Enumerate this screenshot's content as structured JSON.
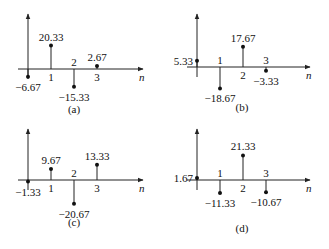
{
  "chart_data": [
    {
      "type": "stem",
      "panel": "(a)",
      "x": [
        0,
        1,
        2,
        3
      ],
      "values": [
        -6.67,
        20.33,
        -15.33,
        2.67
      ],
      "value_labels": [
        "-6.67",
        "20.33",
        "-15.33",
        "2.67"
      ],
      "xlabel": "n",
      "tick_labels": [
        "1",
        "2",
        "3"
      ],
      "caption": "(a)"
    },
    {
      "type": "stem",
      "panel": "(b)",
      "x": [
        0,
        1,
        2,
        3
      ],
      "values": [
        5.33,
        -18.67,
        17.67,
        -3.33
      ],
      "value_labels": [
        "5.33",
        "-18.67",
        "17.67",
        "-3.33"
      ],
      "xlabel": "n",
      "tick_labels": [
        "1",
        "2",
        "3"
      ],
      "caption": "(b)"
    },
    {
      "type": "stem",
      "panel": "(c)",
      "x": [
        0,
        1,
        2,
        3
      ],
      "values": [
        -1.33,
        9.67,
        -20.67,
        13.33
      ],
      "value_labels": [
        "-1.33",
        "9.67",
        "-20.67",
        "13.33"
      ],
      "xlabel": "n",
      "tick_labels": [
        "1",
        "2",
        "3"
      ],
      "caption": "(c)"
    },
    {
      "type": "stem",
      "panel": "(d)",
      "x": [
        0,
        1,
        2,
        3
      ],
      "values": [
        1.67,
        -11.33,
        21.33,
        -10.67
      ],
      "value_labels": [
        "1.67",
        "-11.33",
        "21.33",
        "-10.67"
      ],
      "xlabel": "n",
      "tick_labels": [
        "1",
        "2",
        "3"
      ],
      "caption": "(d)"
    }
  ]
}
